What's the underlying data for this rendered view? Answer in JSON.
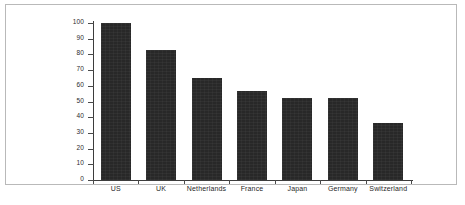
{
  "chart_data": {
    "type": "bar",
    "title": "",
    "subtitle": "",
    "xlabel": "",
    "ylabel": "",
    "categories": [
      "US",
      "UK",
      "Netherlands",
      "France",
      "Japan",
      "Germany",
      "Switzerland"
    ],
    "values": [
      100,
      83,
      65,
      57,
      52,
      52.5,
      36.5
    ],
    "series": [
      {
        "name": "",
        "values": [
          100,
          83,
          65,
          57,
          52,
          52.5,
          36.5
        ]
      }
    ],
    "ylim": [
      0,
      100
    ],
    "yticks": [
      0,
      10,
      20,
      30,
      40,
      50,
      60,
      70,
      80,
      90,
      100
    ],
    "ytick_labels": [
      "0",
      "10",
      "20",
      "30",
      "40",
      "50",
      "60",
      "70",
      "80",
      "90",
      "100"
    ],
    "grid": false,
    "legend": null,
    "legend_position": "none",
    "annotations": [],
    "bar_color": "#282828",
    "axis_color": "#3d3d3d",
    "frame_color": "#b9b9b9",
    "background_color": "#ffffff"
  }
}
